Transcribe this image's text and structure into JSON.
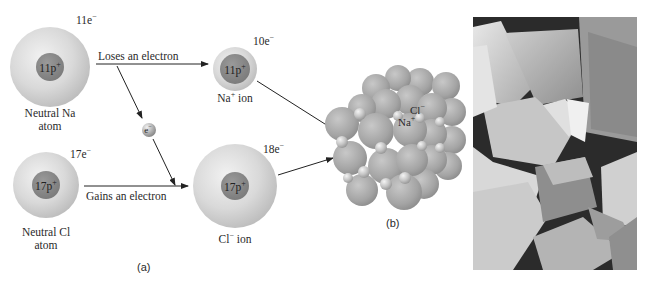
{
  "panel_a": {
    "label": "(a)",
    "neutral_na": {
      "name_line1": "Neutral Na",
      "name_line2": "atom",
      "electrons": "11e",
      "electron_sign": "−",
      "nucleus": "11p",
      "nucleus_sign": "+"
    },
    "na_ion": {
      "name": "Na",
      "name_sign": "+",
      "name_suffix": " ion",
      "electrons": "10e",
      "electron_sign": "−",
      "nucleus": "11p",
      "nucleus_sign": "+"
    },
    "neutral_cl": {
      "name_line1": "Neutral Cl",
      "name_line2": "atom",
      "electrons": "17e",
      "electron_sign": "−",
      "nucleus": "17p",
      "nucleus_sign": "+"
    },
    "cl_ion": {
      "name": "Cl",
      "name_sign": "−",
      "name_suffix": " ion",
      "electrons": "18e",
      "electron_sign": "−",
      "nucleus": "17p",
      "nucleus_sign": "+"
    },
    "electron": {
      "label": "e",
      "sign": "−"
    },
    "arrows": {
      "loses": "Loses an electron",
      "gains": "Gains an electron"
    }
  },
  "panel_b": {
    "label": "(b)",
    "lattice_labels": {
      "cl": "Cl",
      "cl_sign": "−",
      "na": "Na",
      "na_sign": "+"
    }
  },
  "panel_c": {
    "description": "micrograph-of-salt-crystals"
  },
  "colors": {
    "electron_cloud": "#d4d4d4",
    "nucleus": "#8a8a8a",
    "lattice_sphere": "#a9a9a9",
    "arrow": "#222222"
  }
}
